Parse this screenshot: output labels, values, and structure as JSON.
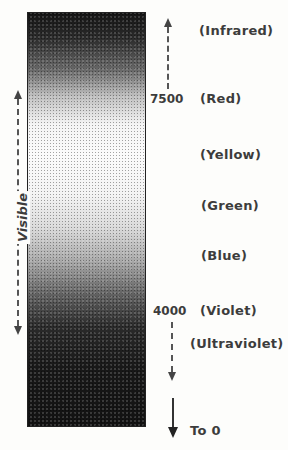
{
  "diagram": {
    "type": "electromagnetic-spectrum-bar",
    "bar_gradient": [
      "#141414",
      "#fbfbfb",
      "#121212"
    ],
    "visible_range_label": "Visible",
    "markers": [
      {
        "value": "7500",
        "label": "(Red)"
      },
      {
        "value": "4000",
        "label": "(Violet)"
      }
    ],
    "bands": [
      {
        "label": "(Infrared)"
      },
      {
        "label": "(Red)"
      },
      {
        "label": "(Yellow)"
      },
      {
        "label": "(Green)"
      },
      {
        "label": "(Blue)"
      },
      {
        "label": "(Violet)"
      },
      {
        "label": "(Ultraviolet)"
      }
    ],
    "bottom_arrow_label": "To 0"
  }
}
